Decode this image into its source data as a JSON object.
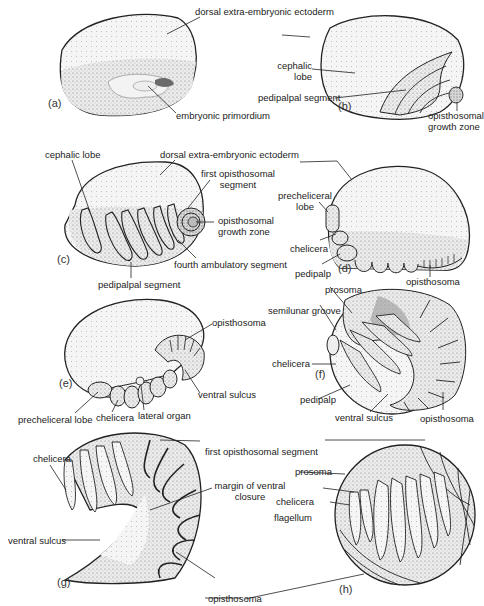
{
  "figure": {
    "panels": [
      {
        "id": "a",
        "tag": "(a)",
        "labels": [
          "dorsal extra-embryonic ectoderm",
          "embryonic primordium"
        ]
      },
      {
        "id": "b",
        "tag": "(b)",
        "labels": [
          "cephalic lobe",
          "pedipalpal segment",
          "opisthosomal growth zone"
        ]
      },
      {
        "id": "c",
        "tag": "(c)",
        "labels": [
          "cephalic lobe",
          "dorsal extra-embryonic ectoderm",
          "first opisthosomal segment",
          "opisthosomal growth zone",
          "fourth ambulatory segment",
          "pedipalpal segment"
        ]
      },
      {
        "id": "d",
        "tag": "(d)",
        "labels": [
          "precheliceral lobe",
          "chelicera",
          "pedipalp",
          "opisthosoma"
        ]
      },
      {
        "id": "e",
        "tag": "(e)",
        "labels": [
          "opisthosoma",
          "ventral sulcus",
          "precheliceral lobe",
          "chelicera",
          "lateral organ"
        ]
      },
      {
        "id": "f",
        "tag": "(f)",
        "labels": [
          "prosoma",
          "semilunar groove",
          "chelicera",
          "pedipalp",
          "ventral sulcus",
          "opisthosoma"
        ]
      },
      {
        "id": "g",
        "tag": "(g)",
        "labels": [
          "chelicera",
          "margin of ventral closure",
          "ventral sulcus",
          "opisthosoma"
        ]
      },
      {
        "id": "h",
        "tag": "(h)",
        "labels": [
          "first opisthosomal segment",
          "prosoma",
          "chelicera",
          "flagellum",
          "opisthosoma"
        ]
      }
    ],
    "text": {
      "a_dorsal": "dorsal extra-embryonic ectoderm",
      "a_embryonic": "embryonic primordium",
      "b_cephalic_1": "cephalic",
      "b_cephalic_2": "lobe",
      "b_pedipalpal": "pedipalpal segment",
      "b_growth_1": "opisthosomal",
      "b_growth_2": "growth zone",
      "c_cephalic": "cephalic lobe",
      "c_dorsal": "dorsal extra-embryonic ectoderm",
      "c_first_1": "first opisthosomal",
      "c_first_2": "segment",
      "c_growth_1": "opisthosomal",
      "c_growth_2": "growth zone",
      "c_fourth": "fourth ambulatory segment",
      "c_pedipalpal": "pedipalpal segment",
      "d_prechel_1": "precheliceral",
      "d_prechel_2": "lobe",
      "d_chelicera": "chelicera",
      "d_pedipalp": "pedipalp",
      "d_opisthosoma": "opisthosoma",
      "e_opisthosoma": "opisthosoma",
      "e_ventral": "ventral sulcus",
      "e_prechel": "precheliceral lobe",
      "e_chelicera": "chelicera",
      "e_lateral": "lateral organ",
      "f_prosoma": "prosoma",
      "f_semilunar": "semilunar groove",
      "f_chelicera": "chelicera",
      "f_pedipalp": "pedipalp",
      "f_ventral": "ventral sulcus",
      "f_opisthosoma": "opisthosoma",
      "g_chelicera": "chelicera",
      "g_first": "first opisthosomal segment",
      "g_margin_1": "margin of ventral",
      "g_margin_2": "closure",
      "g_ventral": "ventral sulcus",
      "g_opisthosoma": "opisthosoma",
      "h_prosoma": "prosoma",
      "h_chelicera": "chelicera",
      "h_flagellum": "flagellum"
    }
  }
}
